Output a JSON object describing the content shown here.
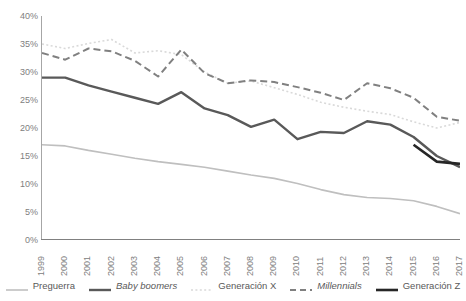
{
  "chart_data": {
    "type": "line",
    "title": "",
    "xlabel": "",
    "ylabel": "",
    "ylim": [
      0,
      40
    ],
    "ytick_labels": [
      "0%",
      "5%",
      "10%",
      "15%",
      "20%",
      "25%",
      "30%",
      "35%",
      "40%"
    ],
    "ytick_values": [
      0,
      5,
      10,
      15,
      20,
      25,
      30,
      35,
      40
    ],
    "grid": false,
    "legend_position": "bottom",
    "categories": [
      "1999",
      "2000",
      "2001",
      "2002",
      "2003",
      "2004",
      "2005",
      "2006",
      "2007",
      "2008",
      "2009",
      "2010",
      "2011",
      "2012",
      "2013",
      "2014",
      "2015",
      "2016",
      "2017"
    ],
    "series": [
      {
        "name": "Preguerra",
        "style": "solid",
        "color": "#bfbfbf",
        "width": 1.6,
        "values": [
          17.0,
          16.8,
          16.0,
          15.3,
          14.6,
          14.0,
          13.5,
          13.0,
          12.3,
          11.6,
          11.0,
          10.1,
          9.0,
          8.1,
          7.6,
          7.4,
          7.0,
          6.0,
          4.7
        ]
      },
      {
        "name": "Baby boomers",
        "style": "solid",
        "color": "#595959",
        "width": 2.4,
        "values": [
          29.0,
          29.0,
          27.6,
          26.5,
          25.4,
          24.3,
          26.4,
          23.5,
          22.3,
          20.2,
          21.5,
          18.0,
          19.3,
          19.1,
          21.2,
          20.6,
          18.4,
          15.0,
          13.0
        ]
      },
      {
        "name": "Generación X",
        "style": "dotted",
        "color": "#d9d9d9",
        "width": 1.6,
        "values": [
          35.0,
          34.2,
          35.1,
          35.8,
          33.4,
          33.8,
          33.1,
          30.0,
          28.0,
          28.4,
          27.2,
          26.0,
          24.6,
          23.7,
          23.0,
          22.4,
          21.1,
          20.0,
          21.0
        ]
      },
      {
        "name": "Millennials",
        "style": "dashed",
        "color": "#808080",
        "width": 2.0,
        "values": [
          33.4,
          32.2,
          34.2,
          33.7,
          32.0,
          29.2,
          34.0,
          29.8,
          28.0,
          28.5,
          28.2,
          27.3,
          26.3,
          25.0,
          28.0,
          27.1,
          25.4,
          22.0,
          21.3
        ]
      },
      {
        "name": "Generación Z",
        "style": "solid",
        "color": "#262626",
        "width": 2.6,
        "values": [
          null,
          null,
          null,
          null,
          null,
          null,
          null,
          null,
          null,
          null,
          null,
          null,
          null,
          null,
          null,
          null,
          17.0,
          14.0,
          13.6
        ]
      }
    ]
  },
  "legend": {
    "items": [
      {
        "label": "Preguerra",
        "italic": false
      },
      {
        "label": "Baby boomers",
        "italic": true
      },
      {
        "label": "Generación X",
        "italic": false
      },
      {
        "label": "Millennials",
        "italic": true
      },
      {
        "label": "Generación Z",
        "italic": false
      }
    ]
  }
}
